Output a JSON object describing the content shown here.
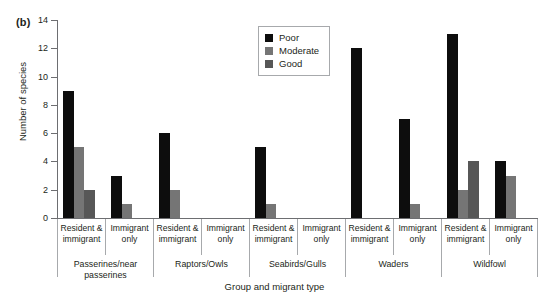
{
  "figure": {
    "panel_label": "(b)"
  },
  "chart_data": {
    "type": "bar",
    "title": "",
    "xlabel": "Group and migrant type",
    "ylabel": "Number of species",
    "ylim": [
      0,
      14
    ],
    "yticks": [
      0,
      2,
      4,
      6,
      8,
      10,
      12,
      14
    ],
    "grid": false,
    "legend_position": "top-center",
    "legend": [
      "Poor",
      "Moderate",
      "Good"
    ],
    "colors": {
      "Poor": "#0d0d0d",
      "Moderate": "#757575",
      "Good": "#575757",
      "axis": "#6d6e71",
      "text": "#231f20"
    },
    "groups": [
      "Passerines/near passerines",
      "Raptors/Owls",
      "Seabirds/Gulls",
      "Waders",
      "Wildfowl"
    ],
    "categories": [
      "Resident & immigrant",
      "Immigrant only",
      "Resident & immigrant",
      "Immigrant only",
      "Resident & immigrant",
      "Immigrant only",
      "Resident & immigrant",
      "Immigrant only",
      "Resident & immigrant",
      "Immigrant only"
    ],
    "series": [
      {
        "name": "Poor",
        "values": [
          9,
          3,
          6,
          0,
          5,
          0,
          12,
          7,
          13,
          4
        ]
      },
      {
        "name": "Moderate",
        "values": [
          5,
          1,
          2,
          0,
          1,
          0,
          0,
          1,
          2,
          3
        ]
      },
      {
        "name": "Good",
        "values": [
          2,
          0,
          0,
          0,
          0,
          0,
          0,
          0,
          4,
          0
        ]
      }
    ]
  }
}
